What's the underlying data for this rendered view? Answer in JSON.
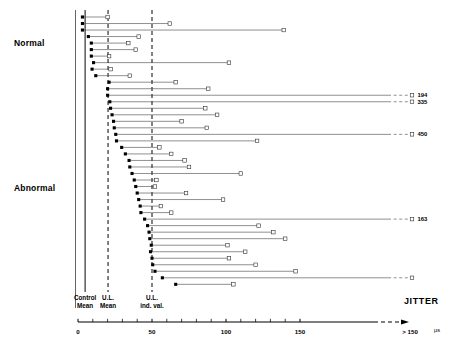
{
  "groups": {
    "normal_label": "Normal",
    "abnormal_label": "Abnormal"
  },
  "axis": {
    "title": "JITTER",
    "unit": "µs",
    "ticks": [
      {
        "value": 0,
        "label": "0"
      },
      {
        "value": 50,
        "label": "50"
      },
      {
        "value": 100,
        "label": "100"
      },
      {
        "value": 150,
        "label": "150"
      }
    ],
    "overflow_label": "> 150",
    "minor_tick_step": 10,
    "range": [
      0,
      150
    ]
  },
  "reference_lines": [
    {
      "name": "control-mean",
      "label_line1": "Control",
      "label_line2": "Mean",
      "value": 4.8,
      "style": "solid"
    },
    {
      "name": "ul-mean",
      "label_line1": "U.L.",
      "label_line2": "Mean",
      "value": 20.3,
      "style": "dashed"
    },
    {
      "name": "ul-ind-val",
      "label_line1": "U.L.",
      "label_line2": "ind. val.",
      "value": 50.0,
      "style": "dashed"
    }
  ],
  "markers": {
    "mean_marker": "filled-square",
    "max_marker": "open-square"
  },
  "chart_data": {
    "type": "range-dot",
    "title": "JITTER",
    "xlabel": "JITTER (µs)",
    "ylabel": "",
    "xlim": [
      0,
      150
    ],
    "grid": false,
    "legend": "none",
    "series": [
      {
        "name": "mean jitter",
        "marker": "filled-square"
      },
      {
        "name": "maximum jitter",
        "marker": "open-square"
      }
    ],
    "categories": [
      "Normal",
      "Abnormal"
    ],
    "rows": [
      {
        "group": "Normal",
        "mean": 3.0,
        "max": 20.0
      },
      {
        "group": "Normal",
        "mean": 3.0,
        "max": 62.0
      },
      {
        "group": "Normal",
        "mean": 3.0,
        "max": 139.0
      },
      {
        "group": "Normal",
        "mean": 7.0,
        "max": 41.0
      },
      {
        "group": "Normal",
        "mean": 9.0,
        "max": 34.0
      },
      {
        "group": "Normal",
        "mean": 9.0,
        "max": 39.0
      },
      {
        "group": "Normal",
        "mean": 9.0,
        "max": 21.0
      },
      {
        "group": "Normal",
        "mean": 10.5,
        "max": 102.0
      },
      {
        "group": "Normal",
        "mean": 9.5,
        "max": 22.0
      },
      {
        "group": "Normal",
        "mean": 12.0,
        "max": 35.0
      },
      {
        "group": "Normal",
        "mean": 21.0,
        "max": 66.0
      },
      {
        "group": "Abnormal",
        "mean": 20.0,
        "max": 88.0
      },
      {
        "group": "Abnormal",
        "mean": 20.0,
        "max": 194.0,
        "offscale": true,
        "value_label": "194"
      },
      {
        "group": "Abnormal",
        "mean": 21.5,
        "max": 335.0,
        "offscale": true,
        "value_label": "335"
      },
      {
        "group": "Abnormal",
        "mean": 22.0,
        "max": 86.0
      },
      {
        "group": "Abnormal",
        "mean": 23.0,
        "max": 94.0
      },
      {
        "group": "Abnormal",
        "mean": 24.0,
        "max": 70.0
      },
      {
        "group": "Abnormal",
        "mean": 24.5,
        "max": 87.0
      },
      {
        "group": "Abnormal",
        "mean": 25.5,
        "max": 450.0,
        "offscale": true,
        "value_label": "450"
      },
      {
        "group": "Abnormal",
        "mean": 26.0,
        "max": 121.0
      },
      {
        "group": "Abnormal",
        "mean": 29.5,
        "max": 55.0
      },
      {
        "group": "Abnormal",
        "mean": 32.0,
        "max": 63.0
      },
      {
        "group": "Abnormal",
        "mean": 34.5,
        "max": 72.0
      },
      {
        "group": "Abnormal",
        "mean": 35.0,
        "max": 75.0
      },
      {
        "group": "Abnormal",
        "mean": 36.5,
        "max": 110.0
      },
      {
        "group": "Abnormal",
        "mean": 38.0,
        "max": 53.0
      },
      {
        "group": "Abnormal",
        "mean": 39.0,
        "max": 52.0
      },
      {
        "group": "Abnormal",
        "mean": 40.0,
        "max": 73.0
      },
      {
        "group": "Abnormal",
        "mean": 41.0,
        "max": 98.0
      },
      {
        "group": "Abnormal",
        "mean": 42.0,
        "max": 56.0
      },
      {
        "group": "Abnormal",
        "mean": 42.5,
        "max": 63.0
      },
      {
        "group": "Abnormal",
        "mean": 45.0,
        "max": 163.0,
        "offscale": true,
        "value_label": "163"
      },
      {
        "group": "Abnormal",
        "mean": 47.0,
        "max": 122.0
      },
      {
        "group": "Abnormal",
        "mean": 48.0,
        "max": 132.0
      },
      {
        "group": "Abnormal",
        "mean": 48.5,
        "max": 140.0
      },
      {
        "group": "Abnormal",
        "mean": 49.5,
        "max": 101.0
      },
      {
        "group": "Abnormal",
        "mean": 49.0,
        "max": 113.0
      },
      {
        "group": "Abnormal",
        "mean": 50.0,
        "max": 102.0
      },
      {
        "group": "Abnormal",
        "mean": 50.5,
        "max": 120.0
      },
      {
        "group": "Abnormal",
        "mean": 52.0,
        "max": 147.0
      },
      {
        "group": "Abnormal",
        "mean": 57.0,
        "max": 178.0,
        "offscale": true
      },
      {
        "group": "Abnormal",
        "mean": 66.0,
        "max": 105.0
      }
    ]
  }
}
